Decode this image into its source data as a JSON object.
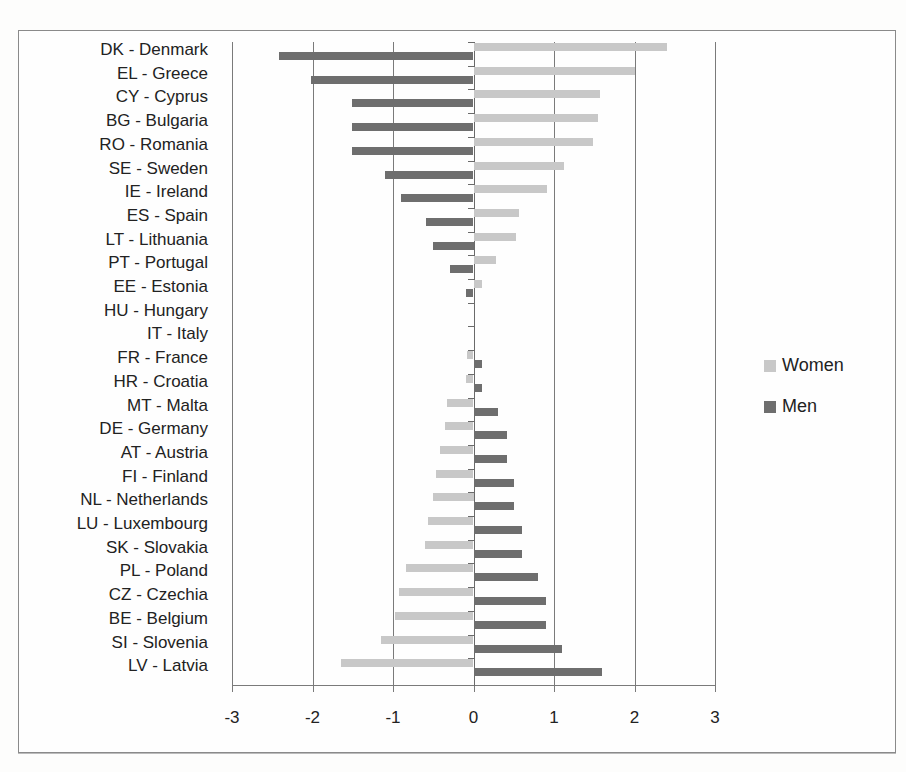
{
  "chart_data": {
    "type": "bar",
    "orientation": "horizontal",
    "title": "",
    "xlabel": "",
    "ylabel": "",
    "xlim": [
      -3,
      3
    ],
    "x_ticks": [
      "-3",
      "-2",
      "-1",
      "0",
      "1",
      "2",
      "3"
    ],
    "grid": true,
    "legend_position": "right",
    "categories": [
      "DK - Denmark",
      "EL - Greece",
      "CY - Cyprus",
      "BG - Bulgaria",
      "RO - Romania",
      "SE - Sweden",
      "IE - Ireland",
      "ES - Spain",
      "LT - Lithuania",
      "PT - Portugal",
      "EE - Estonia",
      "HU - Hungary",
      "IT - Italy",
      "FR - France",
      "HR - Croatia",
      "MT - Malta",
      "DE - Germany",
      "AT - Austria",
      "FI - Finland",
      "NL - Netherlands",
      "LU - Luxembourg",
      "SK - Slovakia",
      "PL - Poland",
      "CZ - Czechia",
      "BE - Belgium",
      "SI - Slovenia",
      "LV - Latvia"
    ],
    "series": [
      {
        "name": "Women",
        "color": "#c8c8c8",
        "values": [
          2.4,
          2.0,
          1.57,
          1.55,
          1.48,
          1.12,
          0.91,
          0.57,
          0.53,
          0.28,
          0.11,
          0,
          0,
          -0.08,
          -0.09,
          -0.33,
          -0.36,
          -0.41,
          -0.47,
          -0.5,
          -0.56,
          -0.6,
          -0.84,
          -0.93,
          -0.97,
          -1.15,
          -1.65
        ]
      },
      {
        "name": "Men",
        "color": "#6e6e6e",
        "values": [
          -2.42,
          -2.02,
          -1.51,
          -1.51,
          -1.51,
          -1.1,
          -0.9,
          -0.59,
          -0.5,
          -0.29,
          -0.09,
          0,
          0,
          0.11,
          0.11,
          0.31,
          0.41,
          0.41,
          0.5,
          0.5,
          0.6,
          0.6,
          0.8,
          0.9,
          0.9,
          1.1,
          1.6
        ]
      }
    ]
  },
  "legend": {
    "women_label": "Women",
    "men_label": "Men"
  }
}
